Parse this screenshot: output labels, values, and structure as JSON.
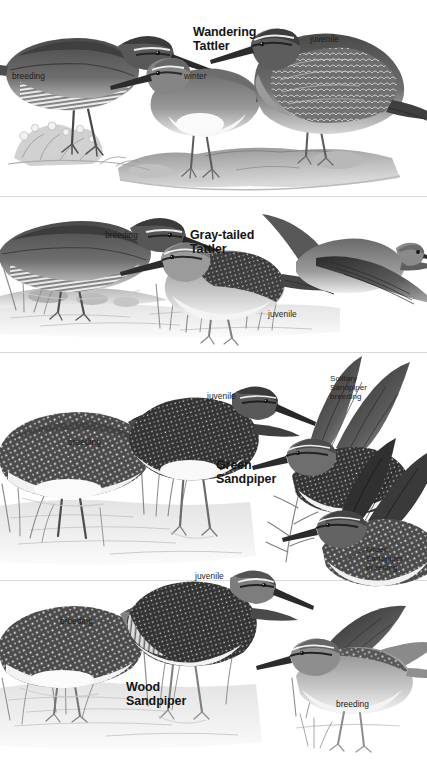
{
  "page": {
    "kind": "field-guide-plate",
    "palette": {
      "background": "#ffffff",
      "ink": "#1d1d1d",
      "title": "#151515",
      "divider": "#d9d9d9",
      "plumage_dark": "#3a3a3a",
      "plumage_mid": "#777777",
      "plumage_light": "#c9c9c9",
      "belly": "#f4f4f4",
      "ground": "#9a9a9a",
      "water": "#dcdcdc"
    },
    "width": 427,
    "height": 761
  },
  "sections": [
    {
      "id": "wandering-tattler",
      "title": "Wandering\nTattler",
      "title_pos": {
        "x": 193,
        "y": 26
      },
      "labels": [
        {
          "id": "breeding",
          "text": "breeding",
          "x": 12,
          "y": 72
        },
        {
          "id": "winter",
          "text": "winter",
          "x": 184,
          "y": 72
        },
        {
          "id": "juvenile",
          "text": "juvenile",
          "x": 310,
          "y": 35
        }
      ],
      "figures": [
        {
          "id": "breeding-adult-standing",
          "pose": "breeding"
        },
        {
          "id": "winter-adult-standing",
          "pose": "winter"
        },
        {
          "id": "juvenile-crouching",
          "pose": "juvenile"
        }
      ]
    },
    {
      "id": "gray-tailed-tattler",
      "title": "Gray-tailed\nTattler",
      "title_pos": {
        "x": 190,
        "y": 229
      },
      "labels": [
        {
          "id": "breeding",
          "text": "breeding",
          "x": 105,
          "y": 231
        },
        {
          "id": "juvenile",
          "text": "juvenile",
          "x": 268,
          "y": 310
        }
      ],
      "figures": [
        {
          "id": "breeding-adult-wading",
          "pose": "breeding"
        },
        {
          "id": "juvenile-standing",
          "pose": "juvenile"
        },
        {
          "id": "adult-in-flight",
          "pose": "flight"
        }
      ]
    },
    {
      "id": "green-sandpiper",
      "title": "Green\nSandpiper",
      "title_pos": {
        "x": 216,
        "y": 459
      },
      "labels": [
        {
          "id": "juvenile",
          "text": "juvenile",
          "x": 207,
          "y": 392
        },
        {
          "id": "breeding",
          "text": "breeding",
          "x": 68,
          "y": 438
        },
        {
          "id": "solitary-sandpiper-breeding",
          "text": "Solitary\nSandpiper\nbreeding",
          "x": 330,
          "y": 374
        },
        {
          "id": "green-sandpiper-breeding",
          "text": "Green\nSandpiper\nbreeding",
          "x": 366,
          "y": 545
        }
      ],
      "figures": [
        {
          "id": "breeding-adult-wading",
          "pose": "breeding"
        },
        {
          "id": "juvenile-standing",
          "pose": "juvenile"
        },
        {
          "id": "solitary-sandpiper-wings-raised",
          "pose": "breeding"
        },
        {
          "id": "green-sandpiper-wings-raised",
          "pose": "breeding"
        }
      ]
    },
    {
      "id": "wood-sandpiper",
      "title": "Wood\nSandpiper",
      "title_pos": {
        "x": 126,
        "y": 681
      },
      "labels": [
        {
          "id": "juvenile",
          "text": "juvenile",
          "x": 195,
          "y": 572
        },
        {
          "id": "breeding",
          "text": "breeding",
          "x": 60,
          "y": 617
        },
        {
          "id": "breeding-right",
          "text": "breeding",
          "x": 336,
          "y": 700
        }
      ],
      "figures": [
        {
          "id": "breeding-adult-wading",
          "pose": "breeding"
        },
        {
          "id": "juvenile-standing",
          "pose": "juvenile"
        },
        {
          "id": "breeding-adult-wings-raised",
          "pose": "breeding"
        }
      ]
    }
  ],
  "dividers": [
    {
      "id": "divider-1",
      "y": 196
    },
    {
      "id": "divider-2",
      "y": 352
    },
    {
      "id": "divider-3",
      "y": 580
    }
  ]
}
